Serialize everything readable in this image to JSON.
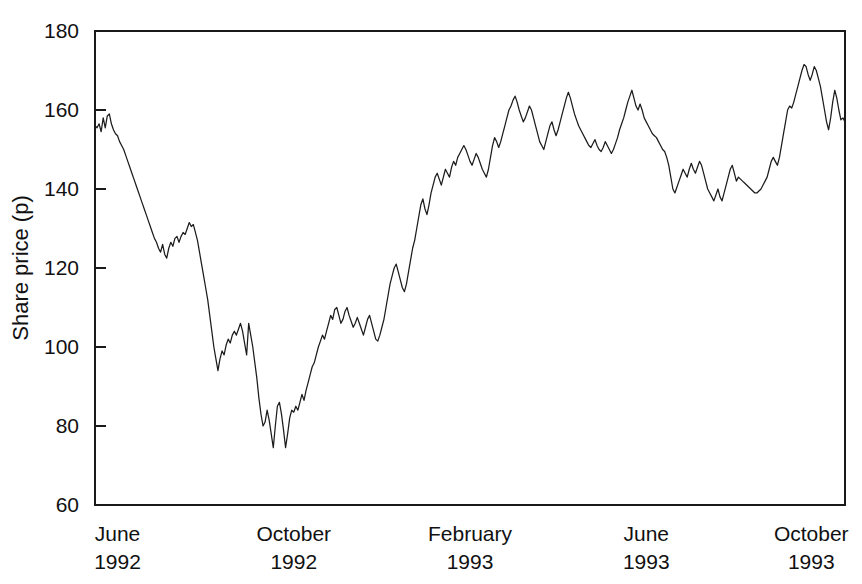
{
  "chart_data": {
    "type": "line",
    "title": "",
    "xlabel": "",
    "ylabel": "Share price (p)",
    "ylim": [
      60,
      180
    ],
    "ytick_labels": [
      "180",
      "160",
      "140",
      "120",
      "100",
      "80",
      "60"
    ],
    "ytick_values": [
      180,
      160,
      140,
      120,
      100,
      80,
      60
    ],
    "xtick_labels": [
      {
        "month": "June",
        "year": "1992"
      },
      {
        "month": "October",
        "year": "1992"
      },
      {
        "month": "February",
        "year": "1993"
      },
      {
        "month": "June",
        "year": "1993"
      },
      {
        "month": "October",
        "year": "1993"
      }
    ],
    "xtick_positions": [
      0.03,
      0.265,
      0.5,
      0.735,
      0.955
    ],
    "grid": false,
    "legend": "none",
    "line_color": "#1c1c1c",
    "series": [
      {
        "name": "Share price",
        "values": [
          156,
          155.5,
          156.5,
          154.5,
          158,
          155.5,
          158.5,
          159,
          156.5,
          155,
          154,
          153.5,
          152,
          151,
          150,
          148.5,
          147,
          145.5,
          144,
          142.5,
          141,
          139.5,
          138,
          136.5,
          135,
          133.5,
          132,
          130.5,
          129,
          127.5,
          126.5,
          125,
          124,
          126,
          123.5,
          122.5,
          125,
          126.5,
          125.5,
          127.5,
          128,
          126.5,
          128,
          129,
          128.5,
          130,
          131.5,
          130.5,
          131,
          129,
          127,
          124,
          121,
          118,
          115,
          112,
          108,
          104,
          100,
          97,
          94,
          97,
          99,
          98,
          100.5,
          102,
          101,
          103,
          104,
          103,
          104.5,
          106,
          104,
          101,
          98,
          106,
          103,
          100,
          96,
          92,
          87,
          83,
          80,
          81,
          84,
          81.5,
          78,
          74.5,
          80,
          85,
          86,
          83,
          79,
          74.5,
          78,
          82,
          84,
          83.5,
          85,
          84,
          86,
          88,
          86.5,
          89,
          91,
          93,
          95,
          96,
          98,
          100,
          101.5,
          103,
          102,
          104,
          106,
          108,
          107,
          109.5,
          110,
          108,
          106,
          107,
          109,
          110,
          108,
          106.5,
          105,
          106,
          107.5,
          106,
          104.5,
          103,
          105,
          107,
          108,
          106,
          104,
          102,
          101.5,
          103,
          105,
          107,
          110,
          113,
          116,
          118,
          120,
          121,
          119,
          117,
          115,
          114,
          116,
          119,
          122,
          125,
          127,
          130,
          133,
          136,
          137.5,
          135,
          133.5,
          136,
          139,
          141,
          143,
          144,
          142.5,
          141,
          143,
          145,
          144,
          143,
          145.5,
          147,
          146,
          148,
          149,
          150,
          151,
          150,
          148.5,
          147,
          146,
          147.5,
          149,
          148,
          146.5,
          145,
          144,
          143,
          145,
          148,
          151,
          153,
          152,
          150.5,
          152,
          154,
          156,
          158,
          160,
          161,
          162.5,
          163.5,
          162,
          160,
          158.5,
          157,
          158,
          159.5,
          161,
          160,
          158,
          156,
          154,
          152,
          151,
          150,
          152,
          154,
          156,
          157,
          155,
          153.5,
          155,
          157,
          159,
          161,
          163,
          164.5,
          163,
          161,
          159,
          157.5,
          156,
          155,
          154,
          153,
          152,
          151,
          150.5,
          151.5,
          152.5,
          151,
          150,
          149.5,
          150.5,
          152,
          151,
          150,
          149,
          150,
          151.5,
          153,
          155,
          156.5,
          158,
          160,
          162,
          163.5,
          165,
          163,
          161,
          160,
          161.5,
          160,
          158,
          157,
          156,
          155,
          154,
          153.5,
          153,
          152,
          151,
          150,
          149.5,
          148,
          146,
          143,
          140,
          139,
          140.5,
          142,
          143.5,
          145,
          144,
          143,
          145,
          146.5,
          145,
          144,
          145.5,
          147,
          146,
          144,
          142,
          140,
          139,
          138,
          137,
          138.5,
          140,
          138,
          137,
          139,
          141,
          143,
          145,
          146,
          144,
          142,
          143,
          142.5,
          142,
          141.5,
          141,
          140.5,
          140,
          139.5,
          139,
          139,
          139.5,
          140,
          141,
          142,
          143,
          145,
          147,
          148,
          147,
          146,
          148,
          151,
          154,
          157,
          160,
          161,
          160.5,
          162,
          164,
          166,
          168,
          170,
          171.5,
          171,
          169,
          167.5,
          169,
          171,
          170,
          168,
          166,
          163,
          160,
          157,
          155,
          158,
          162,
          165,
          163,
          160,
          157.5,
          158,
          157
        ]
      }
    ]
  },
  "axis": {
    "ylabel": "Share price (p)"
  }
}
